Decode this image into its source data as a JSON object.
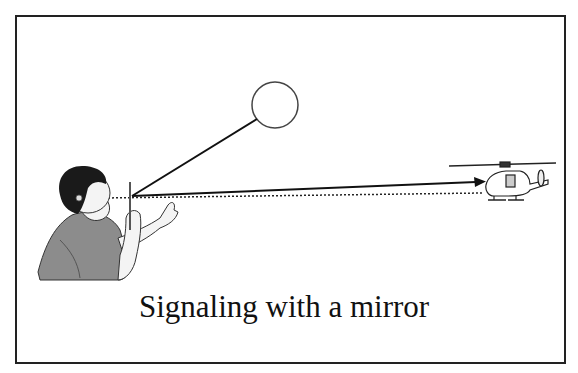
{
  "caption": "Signaling with a mirror",
  "elements": {
    "sun": "sun-circle",
    "person": "person-holding-mirror",
    "helicopter": "helicopter",
    "sun_ray": "sun-ray-line",
    "reflected_ray": "reflected-arrow",
    "sight_line": "dotted-sight-line"
  },
  "colors": {
    "line": "#222222",
    "shirt": "#8c8c8c",
    "hair": "#1a1a1a",
    "skin": "#f2f2f2"
  }
}
